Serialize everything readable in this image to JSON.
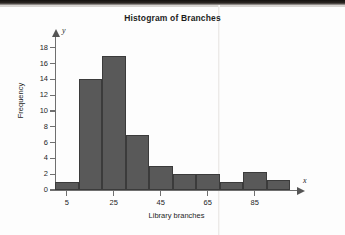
{
  "chart_data": {
    "type": "bar",
    "title": "Histogram of Branches",
    "xlabel": "Library branches",
    "ylabel": "Frequency",
    "axis_letters": {
      "x": "x",
      "y": "y"
    },
    "bin_width": 10,
    "bin_starts": [
      0,
      10,
      20,
      30,
      40,
      50,
      60,
      70,
      80,
      90
    ],
    "categories": [
      "0-10",
      "10-20",
      "20-30",
      "30-40",
      "40-50",
      "50-60",
      "60-70",
      "70-80",
      "80-90",
      "90-100"
    ],
    "values": [
      1,
      14,
      17,
      7,
      3,
      2,
      2,
      1,
      2.3,
      1.3
    ],
    "xlim": [
      0,
      100
    ],
    "ylim": [
      0,
      19
    ],
    "xticks": [
      5,
      25,
      45,
      65,
      85
    ],
    "xtick_labels": [
      "5",
      "25",
      "45",
      "65",
      "85"
    ],
    "yticks": [
      0,
      2,
      4,
      6,
      8,
      10,
      12,
      14,
      16,
      18
    ],
    "ytick_labels": [
      "0",
      "2",
      "4",
      "6",
      "8",
      "10",
      "12",
      "14",
      "16",
      "18"
    ],
    "grid": false,
    "legend": null,
    "bar_color": "#595959",
    "bar_edge_color": "#3b3b3b",
    "axis_color": "#6f6f6f",
    "background_color": "#fdfdfd"
  }
}
